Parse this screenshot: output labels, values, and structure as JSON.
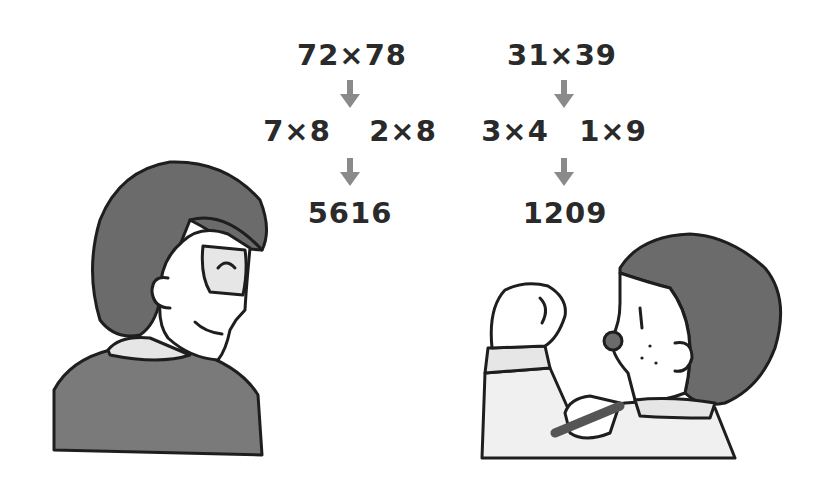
{
  "left_problem": {
    "original": "72×78",
    "split": [
      "7×8",
      "2×8"
    ],
    "result": "5616"
  },
  "right_problem": {
    "original": "31×39",
    "split": [
      "3×4",
      "1×9"
    ],
    "result": "1209"
  },
  "colors": {
    "text": "#2a2a2a",
    "arrow": "#8a8a8a",
    "hair": "#6b6b6b",
    "suit": "#7a7a7a",
    "shirt": "#e6e6e6",
    "outline": "#1e1e1e"
  },
  "characters": [
    {
      "name": "man-with-glasses",
      "position": "left",
      "expression": "smiling, looking back"
    },
    {
      "name": "boy-with-fist",
      "position": "right",
      "expression": "determined, fist raised"
    }
  ]
}
